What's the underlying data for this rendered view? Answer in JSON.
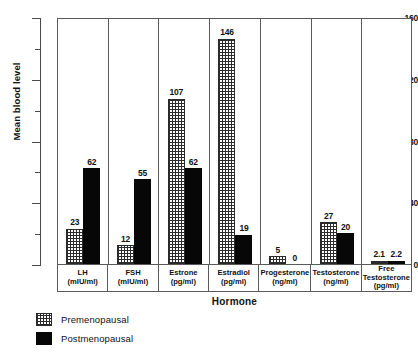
{
  "chart_data": {
    "type": "bar",
    "title": "",
    "xlabel": "Hormone",
    "ylabel": "Mean blood level",
    "ylim": [
      0,
      160
    ],
    "yticks": [
      0,
      40,
      80,
      120,
      160
    ],
    "ytick_labels": [
      "0",
      "40",
      "80",
      "120",
      "160"
    ],
    "yticks_minor": [
      20,
      60,
      100,
      140
    ],
    "grid": false,
    "legend_position": "bottom-left",
    "categories": [
      "LH",
      "FSH",
      "Estrone",
      "Estradiol",
      "Progesterone",
      "Testosterone",
      "Free Testosterone"
    ],
    "category_units": [
      "(mIU/ml)",
      "(mIU/ml)",
      "(pg/ml)",
      "(pg/ml)",
      "(ng/ml)",
      "(ng/ml)",
      "(pg/ml)"
    ],
    "series": [
      {
        "name": "Premenopausal",
        "pattern": "stippled",
        "values": [
          23,
          12,
          107,
          146,
          5,
          27,
          2.1
        ],
        "value_labels": [
          "23",
          "12",
          "107",
          "146",
          "5",
          "27",
          "2.1"
        ]
      },
      {
        "name": "Postmenopausal",
        "pattern": "solid-black",
        "values": [
          62,
          55,
          62,
          19,
          0,
          20,
          2.2
        ],
        "value_labels": [
          "62",
          "55",
          "62",
          "19",
          "0",
          "20",
          "2.2"
        ]
      }
    ]
  },
  "legend": {
    "items": [
      {
        "label": "Premenopausal"
      },
      {
        "label": "Postmenopausal"
      }
    ]
  },
  "axes": {
    "y_title": "Mean blood level",
    "x_title": "Hormone"
  }
}
